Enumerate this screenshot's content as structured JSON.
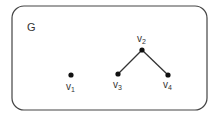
{
  "graph": {
    "name": "G",
    "vertices": [
      {
        "id": "v1",
        "base": "v",
        "sub": "1",
        "x": 71,
        "y": 75
      },
      {
        "id": "v2",
        "base": "v",
        "sub": "2",
        "x": 142,
        "y": 50
      },
      {
        "id": "v3",
        "base": "v",
        "sub": "3",
        "x": 118,
        "y": 74
      },
      {
        "id": "v4",
        "base": "v",
        "sub": "4",
        "x": 168,
        "y": 75
      }
    ],
    "edges": [
      {
        "from": "v2",
        "to": "v3"
      },
      {
        "from": "v2",
        "to": "v4"
      }
    ]
  },
  "colors": {
    "stroke": "#333333",
    "node": "#111111",
    "border": "#444444"
  }
}
